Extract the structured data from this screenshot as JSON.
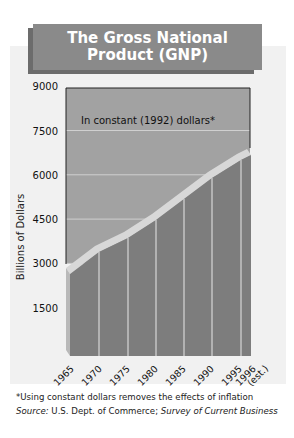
{
  "title_line1": "The Gross National",
  "title_line2": "Product (GNP)",
  "annotation": "In constant (1992) dollars*",
  "footnote": "*Using constant dollars removes the effects of inflation",
  "source_label": "Source:",
  "source_text": " U.S. Dept. of Commerce; ",
  "source_italic": "Survey of Current Business",
  "colors": {
    "title_bg": "#8a8a8a",
    "title_shadow": "#6c6c6c",
    "plot_bg": "#a2a2a2",
    "area_front": "#7d7d7d",
    "area_top": "#d8d8d8",
    "area_side": "#b9b9b9",
    "panel_bg": "#f1f1f1"
  },
  "chart_data": {
    "type": "area",
    "title": "The Gross National Product (GNP)",
    "subtitle": "In constant (1992) dollars*",
    "xlabel": "",
    "ylabel": "Billions of Dollars",
    "categories": [
      "1965",
      "1970",
      "1975",
      "1980",
      "1985",
      "1990",
      "1995",
      "1996 (est.)"
    ],
    "values": [
      2640,
      3390,
      3860,
      4470,
      5180,
      5890,
      6500,
      6670
    ],
    "yticks": [
      1500,
      3000,
      4500,
      6000,
      7500,
      9000
    ],
    "ylim": [
      0,
      9000
    ],
    "grid": true,
    "legend": null,
    "annotations": [
      "*Using constant dollars removes the effects of inflation",
      "Source: U.S. Dept. of Commerce; Survey of Current Business"
    ]
  }
}
